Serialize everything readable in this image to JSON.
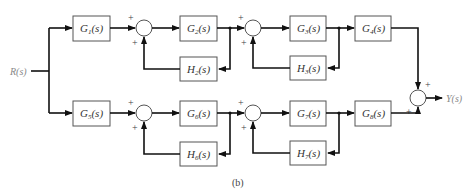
{
  "diagram": {
    "type": "block-diagram",
    "caption": "(b)",
    "input": "R(s)",
    "output": "Y(s)",
    "blocks": {
      "G1": "G1(s)",
      "G2": "G2(s)",
      "G3": "G3(s)",
      "G4": "G4(s)",
      "H2": "H2(s)",
      "H3": "H3(s)",
      "G5": "G5(s)",
      "G6": "G6(s)",
      "G7": "G7(s)",
      "G8": "G8(s)",
      "H6": "H6(s)",
      "H7": "H7(s)"
    },
    "sub": {
      "G1": "1",
      "G2": "2",
      "G3": "3",
      "G4": "4",
      "H2": "2",
      "H3": "3",
      "G5": "5",
      "G6": "6",
      "G7": "7",
      "G8": "8",
      "H6": "6",
      "H7": "7"
    },
    "sign": "+",
    "paths": [
      "R(s) -> G1 -> (+)Sum1 -> G2 -> H2 feedback (+) -> Sum2 -> G3 -> H3 feedback (+) -> G4 -> (+)SumOut",
      "R(s) -> G5 -> (+)Sum3 -> G6 -> H6 feedback (+) -> Sum4 -> G7 -> H7 feedback (+) -> G8 -> (+)SumOut",
      "SumOut -> Y(s)"
    ]
  }
}
